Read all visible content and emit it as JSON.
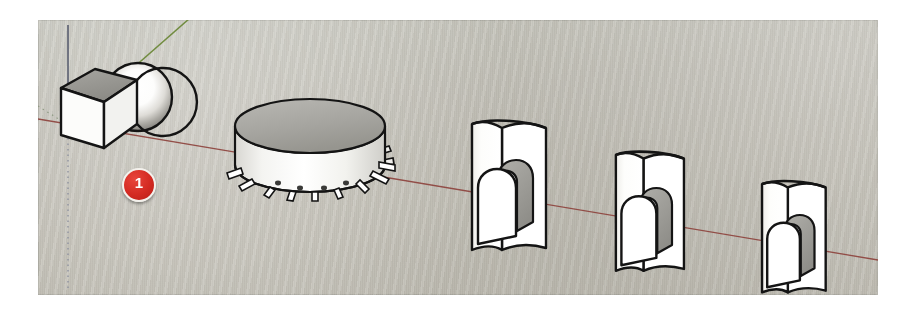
{
  "figure": {
    "app": "SketchUp",
    "viewport": {
      "x": 38,
      "y": 20,
      "width": 840,
      "height": 275,
      "background_color": "#c5c3ba",
      "border_color": "#ffffff"
    }
  },
  "axes": {
    "origin": {
      "x": 68,
      "y": 125
    },
    "red_axis": {
      "name": "red-axis",
      "color": "#8a3a35",
      "label": "X",
      "from": {
        "x": 30,
        "y": 104
      },
      "to": {
        "x": 840,
        "y": 250
      }
    },
    "green_axis": {
      "name": "green-axis",
      "color": "#6d8a3a",
      "label": "Y",
      "from": {
        "x": 68,
        "y": 125
      },
      "to": {
        "x": 200,
        "y": 0
      }
    },
    "blue_axis": {
      "name": "blue-axis",
      "color": "#555a6b",
      "label": "Z",
      "from": {
        "x": 68,
        "y": 0
      },
      "to": {
        "x": 68,
        "y": 275
      },
      "dashed_below_origin": true
    }
  },
  "callouts": [
    {
      "id": "callout-1",
      "label": "1",
      "color": "#d32a22",
      "text_color": "#ffffff",
      "x": 84,
      "y": 148
    }
  ],
  "models": [
    {
      "id": "cube-sphere",
      "name": "cube-with-sphere",
      "type": "solid-group",
      "parts": [
        "cube",
        "sphere"
      ],
      "face_color": "#fbfbf9",
      "top_color": "#9d9d99",
      "side_color": "#d6d6d2",
      "edge_color": "#1a1a1a",
      "position": {
        "x": 50,
        "y": 45
      }
    },
    {
      "id": "cylinder-gear",
      "name": "cylinder-with-pegs",
      "type": "cylinder",
      "face_color": "#f6f6f3",
      "top_color": "#a8a8a3",
      "edge_color": "#1a1a1a",
      "peg_count": 16,
      "position": {
        "x": 200,
        "y": 100
      }
    },
    {
      "id": "arch-wall-1",
      "name": "curved-wall-with-arch",
      "type": "arch-wall",
      "face_color": "#fbfbf9",
      "top_color": "#9b9b96",
      "edge_color": "#1a1a1a",
      "position": {
        "x": 440,
        "y": 108
      },
      "scale": 1.0
    },
    {
      "id": "arch-wall-2",
      "name": "curved-wall-with-arch",
      "type": "arch-wall",
      "face_color": "#fbfbf9",
      "top_color": "#9b9b96",
      "edge_color": "#1a1a1a",
      "position": {
        "x": 590,
        "y": 138
      },
      "scale": 0.92
    },
    {
      "id": "arch-wall-3",
      "name": "curved-wall-with-arch",
      "type": "arch-wall",
      "face_color": "#fbfbf9",
      "top_color": "#9b9b96",
      "edge_color": "#1a1a1a",
      "position": {
        "x": 740,
        "y": 168
      },
      "scale": 0.86
    }
  ]
}
